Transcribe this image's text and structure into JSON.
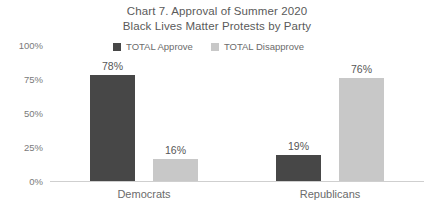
{
  "chart_data": {
    "type": "bar",
    "title": "Chart 7. Approval of Summer 2020 Black Lives Matter Protests by Party",
    "title_lines": [
      "Chart 7. Approval of Summer 2020",
      "Black Lives Matter Protests by Party"
    ],
    "categories": [
      "Democrats",
      "Republicans"
    ],
    "series": [
      {
        "name": "TOTAL Approve",
        "color": "#474747",
        "values": [
          78,
          19
        ],
        "labels": [
          "78%",
          "16%"
        ]
      },
      {
        "name": "TOTAL Disapprove",
        "color": "#c8c8c8",
        "values": [
          16,
          76
        ],
        "labels": [
          "19%",
          "76%"
        ]
      }
    ],
    "bars": [
      {
        "category": "Democrats",
        "series": "TOTAL Approve",
        "value": 78,
        "label": "78%"
      },
      {
        "category": "Democrats",
        "series": "TOTAL Disapprove",
        "value": 16,
        "label": "16%"
      },
      {
        "category": "Republicans",
        "series": "TOTAL Approve",
        "value": 19,
        "label": "19%"
      },
      {
        "category": "Republicans",
        "series": "TOTAL Disapprove",
        "value": 76,
        "label": "76%"
      }
    ],
    "xlabel": "",
    "ylabel": "",
    "ylim": [
      0,
      100
    ],
    "yticks": [
      100,
      75,
      50,
      25,
      0
    ],
    "ytick_labels": [
      "100%",
      "75%",
      "50%",
      "25%",
      "0%"
    ],
    "grid": false,
    "legend_position": "top-center"
  },
  "legend": {
    "items": [
      {
        "label": "TOTAL Approve",
        "color": "#474747"
      },
      {
        "label": "TOTAL Disapprove",
        "color": "#c8c8c8"
      }
    ]
  },
  "colors": {
    "approve": "#474747",
    "disapprove": "#c8c8c8",
    "axis": "#cfcfcf",
    "text": "#6b6b6b",
    "background": "#ffffff"
  }
}
